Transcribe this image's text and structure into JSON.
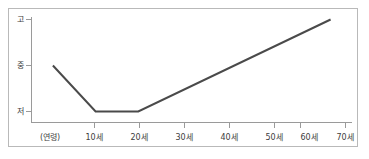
{
  "chart_data": {
    "type": "line",
    "title": "",
    "subtitle": "",
    "xlabel": "(연령)",
    "ylabel": "",
    "x": [
      5,
      10,
      20,
      30,
      40,
      50,
      60,
      70
    ],
    "xtick_labels": [
      "10세",
      "20세",
      "30세",
      "40세",
      "50세",
      "60세",
      "70세"
    ],
    "xtick_values": [
      10,
      20,
      30,
      40,
      50,
      60,
      70
    ],
    "xlim": [
      0,
      75
    ],
    "ytick_labels": [
      "고",
      "중",
      "저"
    ],
    "ytick_values": [
      3,
      2,
      1
    ],
    "ylim": [
      0.6,
      3.2
    ],
    "grid": false,
    "legend": null,
    "legend_position": "none",
    "series": [
      {
        "name": "",
        "points": [
          {
            "x": 5,
            "y": 2.0
          },
          {
            "x": 15,
            "y": 1.0
          },
          {
            "x": 25,
            "y": 1.0
          },
          {
            "x": 70,
            "y": 3.0
          }
        ]
      }
    ],
    "annotations": [],
    "colors": {
      "line": "#4a4a4a",
      "axis": "#9a9a9a",
      "frame": "#b9b9b9",
      "background": "#ffffff",
      "text": "#3d3d3d"
    }
  },
  "axis": {
    "origin_label": "(연령)",
    "y_high": "고",
    "y_mid": "중",
    "y_low": "저"
  }
}
